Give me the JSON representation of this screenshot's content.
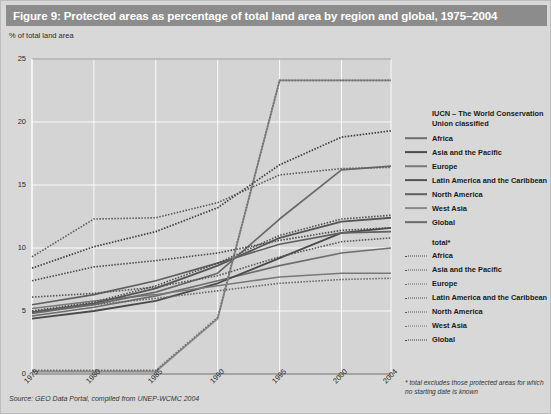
{
  "title": "Figure 9: Protected areas as percentage of total land area by region and global, 1975–2004",
  "source": "Source: GEO Data Portal, compiled from UNEP-WCMC 2004",
  "footnote": "* total excludes those protected areas for which no starting date is known",
  "legend": {
    "group1_title": "IUCN – The World Conservation Union classified",
    "group2_title": "total*",
    "group1_items": [
      {
        "label": "Africa"
      },
      {
        "label": "Asia and the Pacific"
      },
      {
        "label": "Europe"
      },
      {
        "label": "Latin America and the Caribbean"
      },
      {
        "label": "North America"
      },
      {
        "label": "West Asia"
      },
      {
        "label": "Global"
      }
    ],
    "group2_items": [
      {
        "label": "Africa"
      },
      {
        "label": "Asia and the Pacific"
      },
      {
        "label": "Europe"
      },
      {
        "label": "Latin America and the Caribbean"
      },
      {
        "label": "North America"
      },
      {
        "label": "West Asia"
      },
      {
        "label": "Global"
      }
    ]
  },
  "chart_data": {
    "type": "line",
    "title": "Figure 9: Protected areas as percentage of total land area by region and global, 1975–2004",
    "xlabel": "",
    "ylabel": "% of total land area",
    "x": [
      1975,
      1980,
      1985,
      1990,
      1995,
      2000,
      2004
    ],
    "xticklabels": [
      "1975",
      "1980",
      "1985",
      "1990",
      "1995",
      "2000",
      "2004"
    ],
    "yticks": [
      0,
      5,
      10,
      15,
      20,
      25
    ],
    "yticklabels": [
      "0",
      "5",
      "10",
      "15",
      "20",
      "25"
    ],
    "ylim": [
      0,
      25
    ],
    "xlim": [
      1975,
      2004
    ],
    "grid": true,
    "legend_position": "right",
    "series": [
      {
        "name": "Africa",
        "group": "IUCN classified",
        "style": "solid",
        "color": "#6e6e6e",
        "width": 1.6,
        "values": [
          4.6,
          5.3,
          6.2,
          7.4,
          8.6,
          9.6,
          10.0
        ]
      },
      {
        "name": "Asia and the Pacific",
        "group": "IUCN classified",
        "style": "solid",
        "color": "#4a4a4a",
        "width": 1.8,
        "values": [
          4.4,
          5.0,
          5.8,
          7.2,
          9.2,
          11.2,
          11.6
        ]
      },
      {
        "name": "Europe",
        "group": "IUCN classified",
        "style": "solid",
        "color": "#787878",
        "width": 1.5,
        "values": [
          5.2,
          5.8,
          6.3,
          7.0,
          7.7,
          8.0,
          8.0
        ]
      },
      {
        "name": "Latin America and the Caribbean",
        "group": "IUCN classified",
        "style": "solid",
        "color": "#555555",
        "width": 1.8,
        "values": [
          4.9,
          5.6,
          6.8,
          8.6,
          10.8,
          12.1,
          12.4
        ]
      },
      {
        "name": "North America",
        "group": "IUCN classified",
        "style": "solid",
        "color": "#5f5f5f",
        "width": 1.6,
        "values": [
          5.5,
          6.3,
          7.4,
          8.8,
          10.3,
          11.2,
          11.3
        ]
      },
      {
        "name": "West Asia",
        "group": "IUCN classified",
        "style": "solid",
        "color": "#8a8a8a",
        "width": 1.8,
        "values": [
          0.2,
          0.2,
          0.2,
          4.4,
          23.3,
          23.3,
          23.3
        ]
      },
      {
        "name": "Global",
        "group": "IUCN classified",
        "style": "solid",
        "color": "#6a6a6a",
        "width": 1.7,
        "values": [
          4.8,
          5.5,
          6.5,
          8.0,
          12.3,
          16.2,
          16.5
        ]
      },
      {
        "name": "Africa",
        "group": "total",
        "style": "dotted",
        "color": "#4a4a4a",
        "width": 1.6,
        "values": [
          7.4,
          8.5,
          9.0,
          9.6,
          10.6,
          11.4,
          11.6
        ]
      },
      {
        "name": "Asia and the Pacific",
        "group": "total",
        "style": "dotted",
        "color": "#555555",
        "width": 1.6,
        "values": [
          6.1,
          6.4,
          6.9,
          7.8,
          9.3,
          10.5,
          10.8
        ]
      },
      {
        "name": "Europe",
        "group": "total",
        "style": "dotted",
        "color": "#666666",
        "width": 1.6,
        "values": [
          5.0,
          5.5,
          6.0,
          6.6,
          7.2,
          7.5,
          7.6
        ]
      },
      {
        "name": "Latin America and the Caribbean",
        "group": "total",
        "style": "dotted",
        "color": "#4f4f4f",
        "width": 1.6,
        "values": [
          5.0,
          5.7,
          7.0,
          8.8,
          11.0,
          12.3,
          12.6
        ]
      },
      {
        "name": "North America",
        "group": "total",
        "style": "dotted",
        "color": "#5a5a5a",
        "width": 1.6,
        "values": [
          9.3,
          12.3,
          12.4,
          13.6,
          15.8,
          16.3,
          16.4
        ]
      },
      {
        "name": "West Asia",
        "group": "total",
        "style": "dotted",
        "color": "#707070",
        "width": 1.6,
        "values": [
          0.3,
          0.3,
          0.3,
          4.5,
          23.3,
          23.3,
          23.3
        ]
      },
      {
        "name": "Global",
        "group": "total",
        "style": "dotted",
        "color": "#3f3f3f",
        "width": 1.7,
        "values": [
          8.4,
          10.1,
          11.3,
          13.2,
          16.6,
          18.8,
          19.3
        ]
      }
    ]
  }
}
